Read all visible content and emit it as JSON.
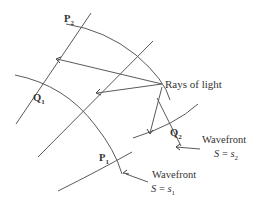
{
  "points": {
    "p1": {
      "label": "P",
      "sub": "1"
    },
    "p2": {
      "label": "P",
      "sub": "2"
    },
    "q1": {
      "label": "Q",
      "sub": "1"
    },
    "q2": {
      "label": "Q",
      "sub": "2"
    }
  },
  "rays_label": "Rays of light",
  "wavefront1": {
    "title": "Wavefront",
    "eq_var": "S",
    "eq_op": " = ",
    "eq_val": "s",
    "eq_sub": "1"
  },
  "wavefront2": {
    "title": "Wavefront",
    "eq_var": "S",
    "eq_op": " = ",
    "eq_val": "s",
    "eq_sub": "2"
  },
  "colors": {
    "line": "#555555",
    "text": "#333333"
  }
}
